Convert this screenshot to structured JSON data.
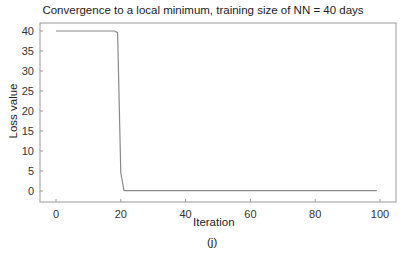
{
  "chart_data": {
    "type": "line",
    "title": "Convergence to a local minimum, training size of NN = 40 days",
    "xlabel": "Iteration",
    "ylabel": "Loss value",
    "sublabel": "(j)",
    "xlim": [
      -5,
      104
    ],
    "ylim": [
      -2,
      41.5
    ],
    "xticks": [
      0,
      20,
      40,
      60,
      80,
      100
    ],
    "yticks": [
      0,
      5,
      10,
      15,
      20,
      25,
      30,
      35,
      40
    ],
    "grid": false,
    "legend": null,
    "series": [
      {
        "name": "Loss",
        "color": "#8a8a8a",
        "x": [
          0,
          1,
          2,
          3,
          4,
          5,
          6,
          7,
          8,
          9,
          10,
          11,
          12,
          13,
          14,
          15,
          16,
          17,
          18,
          19,
          20,
          21,
          22,
          30,
          40,
          50,
          60,
          70,
          80,
          90,
          99
        ],
        "y": [
          40,
          40,
          40,
          40,
          40,
          40,
          40,
          40,
          40,
          40,
          40,
          40,
          40,
          40,
          40,
          40,
          40,
          40,
          40,
          39.6,
          4.5,
          0.1,
          0.1,
          0.1,
          0.1,
          0.1,
          0.1,
          0.1,
          0.1,
          0.1,
          0.1
        ]
      }
    ]
  }
}
